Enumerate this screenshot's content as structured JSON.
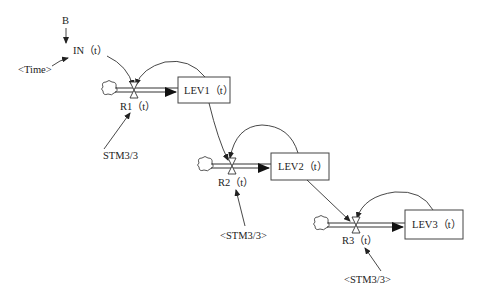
{
  "diagram": {
    "type": "stock-and-flow",
    "nodes": {
      "b": {
        "label": "B"
      },
      "in": {
        "label": "IN（t）"
      },
      "time": {
        "label": "<Time>"
      },
      "r1": {
        "label": "R1（t）"
      },
      "lev1": {
        "label": "LEV1（t）"
      },
      "stm1": {
        "label": "STM3/3"
      },
      "r2": {
        "label": "R2（t）"
      },
      "lev2": {
        "label": "LEV2（t）"
      },
      "stm2": {
        "label": "<STM3/3>"
      },
      "r3": {
        "label": "R3（t）"
      },
      "lev3": {
        "label": "LEV3（t）"
      },
      "stm3": {
        "label": "<STM3/3>"
      }
    },
    "edges": [
      {
        "from": "B",
        "to": "IN（t）"
      },
      {
        "from": "<Time>",
        "to": "IN（t）"
      },
      {
        "from": "IN（t）",
        "to": "R1（t）"
      },
      {
        "from": "LEV1（t）",
        "to": "R1（t）"
      },
      {
        "from": "STM3/3",
        "to": "R1（t）"
      },
      {
        "from": "R1（t）",
        "to": "LEV1（t）",
        "kind": "flow"
      },
      {
        "from": "LEV1（t）",
        "to": "R2（t）"
      },
      {
        "from": "LEV2（t）",
        "to": "R2（t）"
      },
      {
        "from": "<STM3/3>",
        "to": "R2（t）"
      },
      {
        "from": "R2（t）",
        "to": "LEV2（t）",
        "kind": "flow"
      },
      {
        "from": "LEV2（t）",
        "to": "R3（t）"
      },
      {
        "from": "LEV3（t）",
        "to": "R3（t）"
      },
      {
        "from": "<STM3/3>",
        "to": "R3（t）"
      },
      {
        "from": "R3（t）",
        "to": "LEV3（t）",
        "kind": "flow"
      }
    ]
  }
}
